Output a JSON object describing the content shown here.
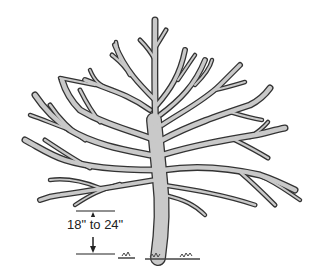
{
  "figure": {
    "dimension": {
      "label": "18\" to 24\"",
      "meaning": "height of lowest branch above ground"
    },
    "colors": {
      "branch_fill": "#c9c9c9",
      "branch_outline": "#333333",
      "background": "#ffffff"
    }
  }
}
